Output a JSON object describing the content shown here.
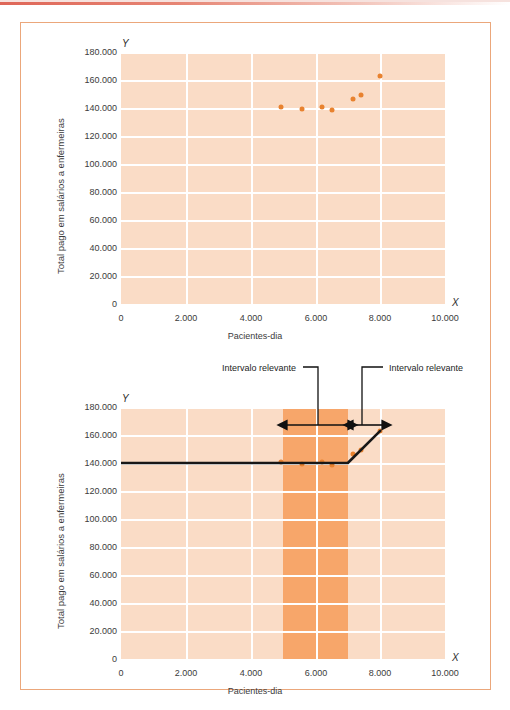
{
  "figure": {
    "border_color": "#eba77b",
    "plot_bg_color": "#fadcc6",
    "band_color": "#f79a55",
    "grid_color": "#ffffff",
    "point_color": "#e8822f",
    "line_color": "#171717"
  },
  "charts": [
    {
      "id": "scatter-top",
      "ylabel": "Total pago em salários a enfermeiras",
      "xlabel": "Pacientes-dia",
      "y_axis_letter": "Y",
      "x_axis_letter": "X",
      "yticks": [
        "180.000",
        "160.000",
        "140.000",
        "120.000",
        "100.000",
        "80.000",
        "60.000",
        "40.000",
        "20.000",
        "0"
      ],
      "xticks": [
        "0",
        "2.000",
        "4.000",
        "6.000",
        "8.000",
        "10.000"
      ]
    },
    {
      "id": "costline-bottom",
      "ylabel": "Total pago em salários a enfermeiras",
      "xlabel": "Pacientes-dia",
      "y_axis_letter": "Y",
      "x_axis_letter": "X",
      "yticks": [
        "180.000",
        "160.000",
        "140.000",
        "120.000",
        "100.000",
        "80.000",
        "60.000",
        "40.000",
        "20.000",
        "0"
      ],
      "xticks": [
        "0",
        "2.000",
        "4.000",
        "6.000",
        "8.000",
        "10.000"
      ],
      "annotations": [
        {
          "label": "Intervalo relevante",
          "from_x": 5000,
          "to_x": 7000
        },
        {
          "label": "Intervalo relevante",
          "from_x": 7000,
          "to_x": 8000
        }
      ]
    }
  ],
  "chart_data": [
    {
      "type": "scatter",
      "title": "",
      "xlabel": "Pacientes-dia",
      "ylabel": "Total pago em salários a enfermeiras",
      "xlim": [
        0,
        10000
      ],
      "ylim": [
        0,
        180000
      ],
      "xticks": [
        0,
        2000,
        4000,
        6000,
        8000,
        10000
      ],
      "xtick_labels": [
        "0",
        "2.000",
        "4.000",
        "6.000",
        "8.000",
        "10.000"
      ],
      "yticks": [
        0,
        20000,
        40000,
        60000,
        80000,
        100000,
        120000,
        140000,
        160000,
        180000
      ],
      "ytick_labels": [
        "0",
        "20.000",
        "40.000",
        "60.000",
        "80.000",
        "100.000",
        "120.000",
        "140.000",
        "160.000",
        "180.000"
      ],
      "grid": true,
      "legend": "none",
      "points": [
        {
          "x": 4950,
          "y": 140500
        },
        {
          "x": 5600,
          "y": 139500
        },
        {
          "x": 6200,
          "y": 141000
        },
        {
          "x": 6500,
          "y": 138500
        },
        {
          "x": 7150,
          "y": 146500
        },
        {
          "x": 7400,
          "y": 149500
        },
        {
          "x": 8000,
          "y": 163000
        }
      ]
    },
    {
      "type": "line",
      "title": "",
      "xlabel": "Pacientes-dia",
      "ylabel": "Total pago em salários a enfermeiras",
      "xlim": [
        0,
        10000
      ],
      "ylim": [
        0,
        180000
      ],
      "xticks": [
        0,
        2000,
        4000,
        6000,
        8000,
        10000
      ],
      "xtick_labels": [
        "0",
        "2.000",
        "4.000",
        "6.000",
        "8.000",
        "10.000"
      ],
      "yticks": [
        0,
        20000,
        40000,
        60000,
        80000,
        100000,
        120000,
        140000,
        160000,
        180000
      ],
      "ytick_labels": [
        "0",
        "20.000",
        "40.000",
        "60.000",
        "80.000",
        "100.000",
        "120.000",
        "140.000",
        "160.000",
        "180.000"
      ],
      "grid": true,
      "legend": "none",
      "series": [
        {
          "name": "Custo total com salários",
          "x": [
            0,
            7000,
            8000
          ],
          "y": [
            140000,
            140000,
            163000
          ]
        }
      ],
      "points": [
        {
          "x": 4950,
          "y": 140500
        },
        {
          "x": 5600,
          "y": 139500
        },
        {
          "x": 6200,
          "y": 141000
        },
        {
          "x": 6500,
          "y": 138500
        },
        {
          "x": 7150,
          "y": 146500
        },
        {
          "x": 7400,
          "y": 149500
        },
        {
          "x": 8000,
          "y": 163000
        }
      ],
      "shaded_bands": [
        {
          "from_x": 5000,
          "to_x": 7000,
          "label": "Intervalo relevante"
        }
      ],
      "annotations": [
        {
          "text": "Intervalo relevante",
          "span_x": [
            5000,
            7000
          ]
        },
        {
          "text": "Intervalo relevante",
          "span_x": [
            7000,
            8000
          ]
        }
      ]
    }
  ]
}
